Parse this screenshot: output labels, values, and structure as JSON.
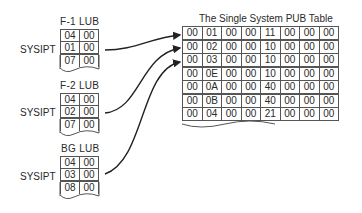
{
  "lubs": [
    {
      "title": "F-1 LUB",
      "label": "SYSIPT",
      "rows": [
        [
          "04",
          "00"
        ],
        [
          "01",
          "00"
        ],
        [
          "07",
          "00"
        ]
      ],
      "pointer_row": 1
    },
    {
      "title": "F-2 LUB",
      "label": "SYSIPT",
      "rows": [
        [
          "04",
          "00"
        ],
        [
          "02",
          "00"
        ],
        [
          "07",
          "00"
        ]
      ],
      "pointer_row": 1
    },
    {
      "title": "BG LUB",
      "label": "SYSIPT",
      "rows": [
        [
          "04",
          "00"
        ],
        [
          "03",
          "00"
        ],
        [
          "08",
          "00"
        ]
      ],
      "pointer_row": 1
    }
  ],
  "pub_table": {
    "title": "The Single System PUB Table",
    "rows": [
      [
        "00",
        "01",
        "00",
        "00",
        "11",
        "00",
        "00",
        "00"
      ],
      [
        "00",
        "02",
        "00",
        "00",
        "10",
        "00",
        "00",
        "00"
      ],
      [
        "00",
        "03",
        "00",
        "00",
        "10",
        "00",
        "00",
        "00"
      ],
      [
        "00",
        "0E",
        "00",
        "00",
        "10",
        "00",
        "00",
        "00"
      ],
      [
        "00",
        "0A",
        "00",
        "00",
        "40",
        "00",
        "00",
        "00"
      ],
      [
        "00",
        "0B",
        "00",
        "00",
        "40",
        "00",
        "00",
        "00"
      ],
      [
        "00",
        "04",
        "00",
        "00",
        "21",
        "00",
        "00",
        "00"
      ]
    ]
  },
  "arrows": [
    {
      "from": "F-1 LUB SYSIPT",
      "to_pub_row": 0
    },
    {
      "from": "F-2 LUB SYSIPT",
      "to_pub_row": 1
    },
    {
      "from": "BG LUB SYSIPT",
      "to_pub_row": 2
    }
  ]
}
